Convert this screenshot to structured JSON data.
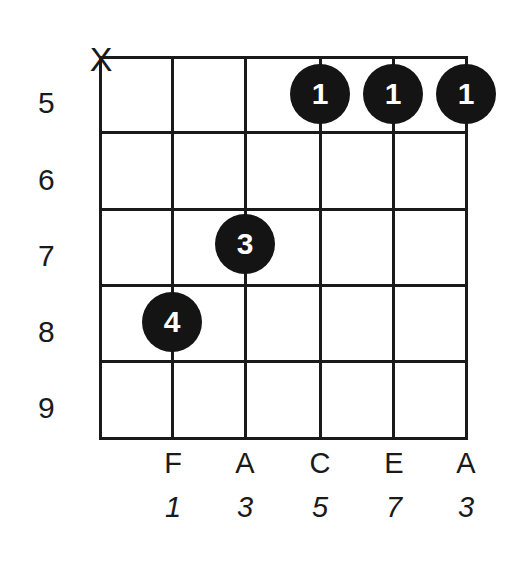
{
  "diagram": {
    "type": "guitar-chord-diagram",
    "strings": 6,
    "frets_shown": [
      5,
      6,
      7,
      8,
      9
    ],
    "fret_labels": [
      "5",
      "6",
      "7",
      "8",
      "9"
    ],
    "muted_strings": [
      {
        "string": 1,
        "symbol": "X"
      }
    ],
    "fingers": [
      {
        "string": 2,
        "fret": 8,
        "finger": "4"
      },
      {
        "string": 3,
        "fret": 7,
        "finger": "3"
      },
      {
        "string": 4,
        "fret": 5,
        "finger": "1"
      },
      {
        "string": 5,
        "fret": 5,
        "finger": "1"
      },
      {
        "string": 6,
        "fret": 5,
        "finger": "1"
      }
    ],
    "notes": [
      "F",
      "A",
      "C",
      "E",
      "A"
    ],
    "intervals": [
      "1",
      "3",
      "5",
      "7",
      "3"
    ],
    "colors": {
      "line": "#1a1a1a",
      "dot": "#141414",
      "dot_text": "#ffffff",
      "background": "#ffffff"
    }
  }
}
